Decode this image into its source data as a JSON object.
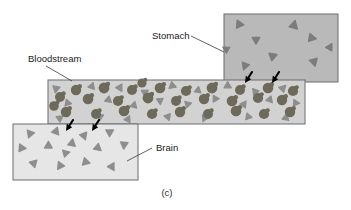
{
  "figure": {
    "caption": "(c)",
    "background_color": "#ffffff"
  },
  "labels": {
    "stomach": "Stomach",
    "bloodstream": "Bloodstream",
    "brain": "Brain"
  },
  "colors": {
    "stomach_fill": "#b9b9b9",
    "bloodstream_fill": "#d2d2d2",
    "brain_fill": "#e6e6e6",
    "box_border": "#6d6d6d",
    "triangle": "#8e8e8e",
    "triangle_dark": "#7c7c7c",
    "cell": "#6e6a5a",
    "arrow": "#000000",
    "leader_line": "#3a3a3a",
    "text": "#1a1a1a"
  },
  "regions": [
    {
      "name": "stomach",
      "label": "Stomach",
      "x": 224,
      "y": 14,
      "width": 114,
      "height": 68,
      "fill": "#b9b9b9",
      "contents": "drug-particles"
    },
    {
      "name": "bloodstream",
      "label": "Bloodstream",
      "x": 48,
      "y": 80,
      "width": 257,
      "height": 44,
      "fill": "#d2d2d2",
      "contents": "blood-cells-and-drug-particles"
    },
    {
      "name": "brain",
      "label": "Brain",
      "x": 13,
      "y": 124,
      "width": 125,
      "height": 56,
      "fill": "#e6e6e6",
      "contents": "drug-particles"
    }
  ],
  "stomach_particles": [
    {
      "x": 239,
      "y": 24,
      "r": -25,
      "s": 1.0
    },
    {
      "x": 294,
      "y": 25,
      "r": 15,
      "s": 1.05
    },
    {
      "x": 256,
      "y": 40,
      "r": 180,
      "s": 0.95
    },
    {
      "x": 312,
      "y": 38,
      "r": 100,
      "s": 1.0
    },
    {
      "x": 273,
      "y": 56,
      "r": 70,
      "s": 1.0
    },
    {
      "x": 245,
      "y": 66,
      "r": 200,
      "s": 0.95
    },
    {
      "x": 314,
      "y": 62,
      "r": 165,
      "s": 1.0
    },
    {
      "x": 330,
      "y": 47,
      "r": 30,
      "s": 0.9
    },
    {
      "x": 226,
      "y": 49,
      "r": -60,
      "s": 0.85
    }
  ],
  "bloodstream_particles": [
    {
      "x": 56,
      "y": 89,
      "r": 190,
      "s": 0.9
    },
    {
      "x": 92,
      "y": 86,
      "r": 20,
      "s": 0.85
    },
    {
      "x": 120,
      "y": 88,
      "r": 150,
      "s": 0.9
    },
    {
      "x": 145,
      "y": 92,
      "r": 60,
      "s": 0.85
    },
    {
      "x": 172,
      "y": 86,
      "r": 230,
      "s": 0.9
    },
    {
      "x": 198,
      "y": 90,
      "r": 10,
      "s": 0.85
    },
    {
      "x": 228,
      "y": 86,
      "r": 120,
      "s": 0.9
    },
    {
      "x": 255,
      "y": 92,
      "r": 200,
      "s": 0.85
    },
    {
      "x": 283,
      "y": 88,
      "r": 45,
      "s": 0.9
    },
    {
      "x": 68,
      "y": 103,
      "r": 100,
      "s": 0.85
    },
    {
      "x": 108,
      "y": 100,
      "r": 250,
      "s": 0.85
    },
    {
      "x": 134,
      "y": 105,
      "r": 15,
      "s": 0.85
    },
    {
      "x": 160,
      "y": 101,
      "r": 175,
      "s": 0.85
    },
    {
      "x": 188,
      "y": 104,
      "r": 75,
      "s": 0.85
    },
    {
      "x": 215,
      "y": 99,
      "r": 210,
      "s": 0.85
    },
    {
      "x": 244,
      "y": 104,
      "r": 35,
      "s": 0.85
    },
    {
      "x": 270,
      "y": 100,
      "r": 140,
      "s": 0.85
    },
    {
      "x": 296,
      "y": 103,
      "r": 95,
      "s": 0.85
    },
    {
      "x": 60,
      "y": 118,
      "r": 55,
      "s": 0.85
    },
    {
      "x": 100,
      "y": 117,
      "r": 185,
      "s": 0.85
    },
    {
      "x": 128,
      "y": 119,
      "r": 25,
      "s": 0.85
    },
    {
      "x": 168,
      "y": 117,
      "r": 160,
      "s": 0.85
    },
    {
      "x": 205,
      "y": 118,
      "r": 85,
      "s": 0.85
    },
    {
      "x": 248,
      "y": 117,
      "r": 220,
      "s": 0.85
    },
    {
      "x": 286,
      "y": 118,
      "r": 130,
      "s": 0.85
    }
  ],
  "blood_cells": [
    {
      "x": 76,
      "y": 90,
      "r": 5.2
    },
    {
      "x": 104,
      "y": 88,
      "r": 5.4
    },
    {
      "x": 132,
      "y": 90,
      "r": 5.0
    },
    {
      "x": 160,
      "y": 88,
      "r": 5.3
    },
    {
      "x": 186,
      "y": 91,
      "r": 5.1
    },
    {
      "x": 212,
      "y": 88,
      "r": 5.4
    },
    {
      "x": 240,
      "y": 90,
      "r": 5.0
    },
    {
      "x": 268,
      "y": 88,
      "r": 5.3
    },
    {
      "x": 293,
      "y": 91,
      "r": 5.1
    },
    {
      "x": 60,
      "y": 97,
      "r": 5.0
    },
    {
      "x": 88,
      "y": 99,
      "r": 5.3
    },
    {
      "x": 118,
      "y": 101,
      "r": 5.1
    },
    {
      "x": 148,
      "y": 98,
      "r": 5.4
    },
    {
      "x": 176,
      "y": 101,
      "r": 5.0
    },
    {
      "x": 204,
      "y": 99,
      "r": 5.2
    },
    {
      "x": 232,
      "y": 101,
      "r": 5.3
    },
    {
      "x": 258,
      "y": 98,
      "r": 5.1
    },
    {
      "x": 282,
      "y": 100,
      "r": 5.2
    },
    {
      "x": 66,
      "y": 112,
      "r": 5.2
    },
    {
      "x": 96,
      "y": 114,
      "r": 5.0
    },
    {
      "x": 124,
      "y": 111,
      "r": 5.3
    },
    {
      "x": 152,
      "y": 114,
      "r": 5.1
    },
    {
      "x": 180,
      "y": 112,
      "r": 5.2
    },
    {
      "x": 208,
      "y": 114,
      "r": 5.0
    },
    {
      "x": 236,
      "y": 111,
      "r": 5.3
    },
    {
      "x": 264,
      "y": 114,
      "r": 5.1
    },
    {
      "x": 290,
      "y": 112,
      "r": 5.2
    },
    {
      "x": 54,
      "y": 106,
      "r": 4.8
    },
    {
      "x": 142,
      "y": 83,
      "r": 4.6
    }
  ],
  "brain_particles": [
    {
      "x": 30,
      "y": 134,
      "r": 200,
      "s": 0.95
    },
    {
      "x": 56,
      "y": 131,
      "r": 20,
      "s": 0.95
    },
    {
      "x": 84,
      "y": 136,
      "r": 160,
      "s": 0.95
    },
    {
      "x": 110,
      "y": 132,
      "r": 60,
      "s": 0.95
    },
    {
      "x": 22,
      "y": 148,
      "r": 95,
      "s": 0.95
    },
    {
      "x": 48,
      "y": 146,
      "r": 240,
      "s": 0.95
    },
    {
      "x": 72,
      "y": 143,
      "r": 10,
      "s": 0.95
    },
    {
      "x": 98,
      "y": 148,
      "r": 130,
      "s": 0.95
    },
    {
      "x": 124,
      "y": 145,
      "r": 185,
      "s": 0.95
    },
    {
      "x": 34,
      "y": 163,
      "r": 45,
      "s": 0.95
    },
    {
      "x": 60,
      "y": 166,
      "r": 215,
      "s": 0.95
    },
    {
      "x": 86,
      "y": 162,
      "r": 105,
      "s": 0.95
    },
    {
      "x": 112,
      "y": 167,
      "r": 150,
      "s": 0.95
    },
    {
      "x": 66,
      "y": 153,
      "r": 75,
      "s": 0.9
    }
  ],
  "arrows": [
    {
      "name": "stomach-to-bloodstream-1",
      "tip_x": 245,
      "tip_y": 83,
      "tail_x": 252,
      "tail_y": 72
    },
    {
      "name": "stomach-to-bloodstream-2",
      "tip_x": 272,
      "tip_y": 83,
      "tail_x": 279,
      "tail_y": 72
    },
    {
      "name": "bloodstream-to-brain-1",
      "tip_x": 66,
      "tip_y": 131,
      "tail_x": 73,
      "tail_y": 120
    },
    {
      "name": "bloodstream-to-brain-2",
      "tip_x": 92,
      "tip_y": 131,
      "tail_x": 99,
      "tail_y": 120
    }
  ],
  "leaders": [
    {
      "name": "stomach-leader",
      "x1": 191,
      "y1": 36,
      "x2": 224,
      "y2": 52
    },
    {
      "name": "bloodstream-leader",
      "x1": 46,
      "y1": 66,
      "x2": 72,
      "y2": 81
    },
    {
      "name": "brain-leader",
      "x1": 152,
      "y1": 148,
      "x2": 127,
      "y2": 161
    }
  ],
  "label_positions": {
    "stomach": {
      "x": 152,
      "y": 39
    },
    "bloodstream": {
      "x": 28,
      "y": 62
    },
    "brain": {
      "x": 156,
      "y": 151
    },
    "caption": {
      "x": 167,
      "y": 196
    }
  }
}
